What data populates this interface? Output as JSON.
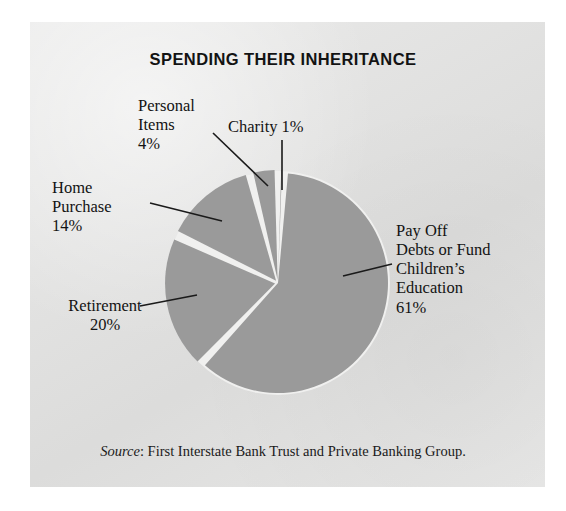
{
  "figure": {
    "title": "SPENDING THEIR INHERITANCE",
    "source_word": "Source",
    "source_rest": ": First Interstate Bank Trust and Private Banking Group."
  },
  "labels": {
    "personal_items": "Personal\nItems\n4%",
    "charity": "Charity 1%",
    "home_purchase": "Home\nPurchase\n14%",
    "retirement": "Retirement\n20%",
    "payoff_debts": "Pay Off\nDebts or Fund\nChildren’s\nEducation\n61%"
  },
  "colors": {
    "page_background": "#ffffff",
    "panel_background": "#e3e3e2",
    "slice_fill": "#9a9a9a",
    "slice_gap": "#f0f0ef",
    "text": "#131313",
    "leader_line": "#1a1a1a"
  },
  "chart_data": {
    "type": "pie",
    "title": "SPENDING THEIR INHERITANCE",
    "categories": [
      "Pay Off Debts or Fund Children’s Education",
      "Retirement",
      "Home Purchase",
      "Personal Items",
      "Charity"
    ],
    "values": [
      61,
      20,
      14,
      4,
      1
    ],
    "value_unit": "percent",
    "labels": [
      "Pay Off Debts or Fund Children’s Education 61%",
      "Retirement 20%",
      "Home Purchase 14%",
      "Personal Items 4%",
      "Charity 1%"
    ],
    "start_angle_deg": 0,
    "direction": "clockwise",
    "legend": "none",
    "grid": false,
    "xlabel": "",
    "ylabel": "",
    "annotations": [
      "Source: First Interstate Bank Trust and Private Banking Group."
    ],
    "geometry": {
      "center_x": 278,
      "center_y": 283,
      "radius": 110
    },
    "slices": [
      {
        "name": "Charity",
        "value": 1,
        "start_deg": 0.0,
        "end_deg": 3.6
      },
      {
        "name": "Pay Off Debts or Fund Children’s Education",
        "value": 61,
        "start_deg": 3.6,
        "end_deg": 223.2
      },
      {
        "name": "Retirement",
        "value": 20,
        "start_deg": 223.2,
        "end_deg": 295.2
      },
      {
        "name": "Home Purchase",
        "value": 14,
        "start_deg": 295.2,
        "end_deg": 345.6
      },
      {
        "name": "Personal Items",
        "value": 4,
        "start_deg": 345.6,
        "end_deg": 360.0
      }
    ]
  }
}
